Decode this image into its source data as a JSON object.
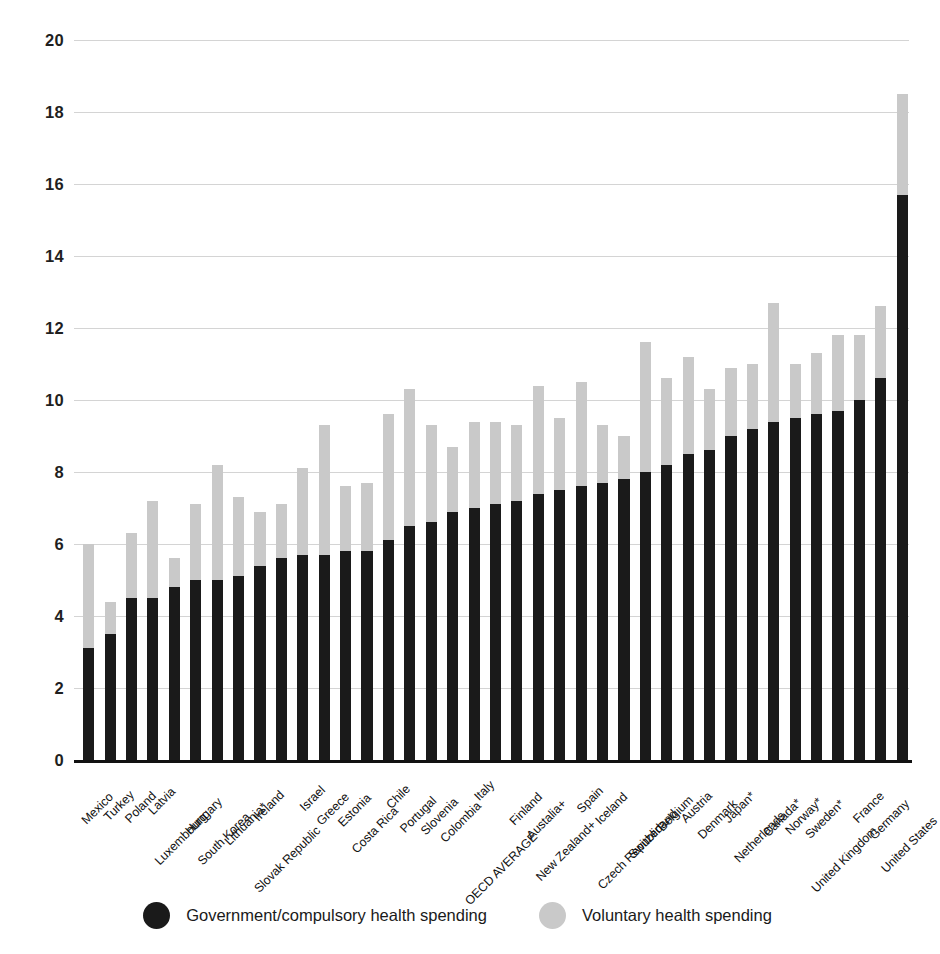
{
  "chart_data": {
    "type": "bar",
    "stacked": true,
    "title": "",
    "subtitle": "",
    "xlabel": "",
    "ylabel": "Percent of gross domestic product",
    "ylim": [
      0,
      20
    ],
    "ytick_step": 2,
    "yticks": [
      "20",
      "18",
      "16",
      "14",
      "12",
      "10",
      "8",
      "6",
      "4",
      "2",
      "0"
    ],
    "grid": true,
    "legend_position": "bottom",
    "colors": {
      "government": "#1a1a1a",
      "voluntary": "#c9c9c9",
      "gridline": "#d4d4d4",
      "axis": "#111111",
      "background": "#ffffff"
    },
    "categories": [
      "Mexico",
      "Turkey",
      "Poland",
      "Latvia",
      "Luxembourg",
      "Hungary",
      "South Korea",
      "Lithuania*",
      "Ireland",
      "Slovak Republic",
      "Israel",
      "Greece",
      "Estonia",
      "Costa Rica",
      "Chile",
      "Portugal",
      "Slovenia",
      "Colombia",
      "Italy",
      "OECD AVERAGE",
      "Finland",
      "Austalia+",
      "New Zealand+",
      "Spain",
      "Iceland",
      "Czech Republic",
      "Switzerland",
      "Belgium",
      "Austria",
      "Denmark",
      "Japan*",
      "Netherlands",
      "Canada*",
      "Norway*",
      "Sweden*",
      "United Kingdom",
      "France",
      "Germany",
      "United States"
    ],
    "series": [
      {
        "name": "Government/compulsory health spending",
        "color": "#1a1a1a",
        "values": [
          3.1,
          3.5,
          4.5,
          4.5,
          4.8,
          5.0,
          5.0,
          5.1,
          5.4,
          5.6,
          5.7,
          5.7,
          5.8,
          5.8,
          6.1,
          6.5,
          6.6,
          6.9,
          7.0,
          7.1,
          7.2,
          7.4,
          7.5,
          7.6,
          7.7,
          7.8,
          8.0,
          8.2,
          8.5,
          8.6,
          9.0,
          9.2,
          9.4,
          9.5,
          9.6,
          9.7,
          10.0,
          10.6,
          15.7
        ]
      },
      {
        "name": "Voluntary health spending",
        "color": "#c9c9c9",
        "values": [
          2.9,
          0.9,
          1.8,
          2.7,
          0.8,
          2.1,
          3.2,
          2.2,
          1.5,
          1.5,
          2.4,
          3.6,
          1.8,
          1.9,
          3.5,
          3.8,
          2.7,
          1.8,
          2.4,
          2.3,
          2.1,
          3.0,
          2.0,
          2.9,
          1.6,
          1.2,
          3.6,
          2.4,
          2.7,
          1.7,
          1.9,
          1.8,
          3.3,
          1.5,
          1.7,
          2.1,
          1.8,
          2.0,
          2.8
        ]
      }
    ],
    "totals": [
      6.0,
      4.4,
      6.3,
      7.2,
      5.6,
      7.1,
      8.2,
      7.3,
      6.9,
      7.1,
      8.1,
      9.3,
      7.6,
      7.7,
      9.6,
      10.3,
      9.3,
      8.7,
      9.4,
      9.4,
      9.3,
      10.4,
      9.5,
      10.5,
      9.3,
      9.0,
      11.6,
      10.6,
      11.2,
      10.3,
      10.9,
      11.0,
      12.7,
      11.0,
      11.3,
      11.8,
      11.8,
      12.6,
      18.5
    ]
  },
  "legend": {
    "items": [
      {
        "label": "Government/compulsory health spending",
        "color": "#1a1a1a",
        "swatch": "circle-dark"
      },
      {
        "label": "Voluntary health spending",
        "color": "#c9c9c9",
        "swatch": "circle-light"
      }
    ]
  }
}
